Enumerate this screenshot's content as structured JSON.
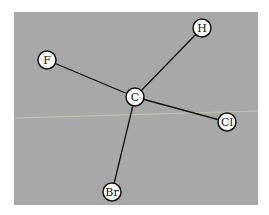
{
  "diagram": {
    "title": "",
    "background": "#a9a9a9",
    "panel": {
      "x": 14,
      "y": 12,
      "width": 244,
      "height": 193
    },
    "colors": {
      "panel": "#a8a8a8",
      "node_fill": "#ffffff",
      "node_stroke": "#111111",
      "bond": "#111111",
      "artifact_line": "#d8d2b8"
    },
    "nodes": [
      {
        "id": "C",
        "label": "C",
        "x": 135,
        "y": 97,
        "r": 9
      },
      {
        "id": "H",
        "label": "H",
        "x": 202,
        "y": 28,
        "r": 9
      },
      {
        "id": "F",
        "label": "F",
        "x": 47,
        "y": 60,
        "r": 9
      },
      {
        "id": "Cl",
        "label": "Cl",
        "x": 227,
        "y": 122,
        "r": 9
      },
      {
        "id": "Br",
        "label": "Br",
        "x": 112,
        "y": 192,
        "r": 9
      }
    ],
    "edges": [
      {
        "from": "C",
        "to": "H"
      },
      {
        "from": "C",
        "to": "F"
      },
      {
        "from": "C",
        "to": "Cl"
      },
      {
        "from": "C",
        "to": "Br"
      }
    ]
  }
}
